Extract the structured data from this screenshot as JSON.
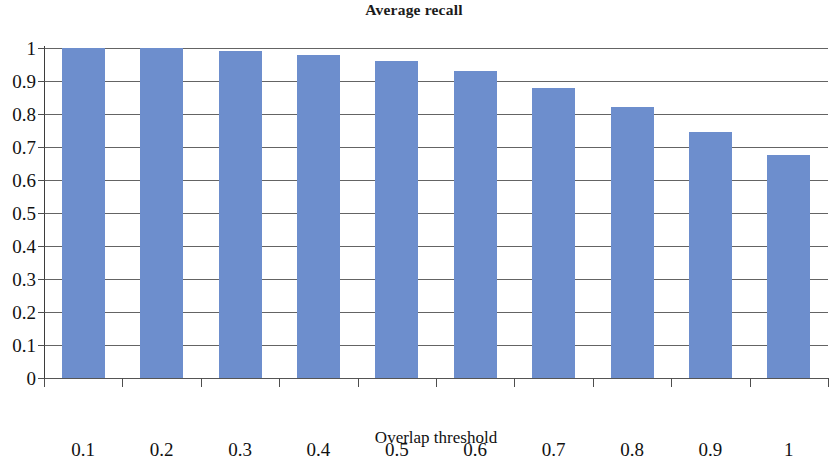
{
  "chart_data": {
    "type": "bar",
    "title": "Average recall",
    "xlabel": "Overlap threshold",
    "ylabel": "",
    "categories": [
      "0.1",
      "0.2",
      "0.3",
      "0.4",
      "0.5",
      "0.6",
      "0.7",
      "0.8",
      "0.9",
      "1"
    ],
    "values": [
      1.0,
      1.0,
      0.99,
      0.98,
      0.96,
      0.93,
      0.88,
      0.82,
      0.745,
      0.675
    ],
    "series": [
      {
        "name": "Average recall",
        "values": [
          1.0,
          1.0,
          0.99,
          0.98,
          0.96,
          0.93,
          0.88,
          0.82,
          0.745,
          0.675
        ]
      }
    ],
    "ylim": [
      0,
      1
    ],
    "ytick_labels": [
      "1",
      "0.9",
      "0.8",
      "0.7",
      "0.6",
      "0.5",
      "0.4",
      "0.3",
      "0.2",
      "0.1",
      "0"
    ],
    "ytick_values": [
      1,
      0.9,
      0.8,
      0.7,
      0.6,
      0.5,
      0.4,
      0.3,
      0.2,
      0.1,
      0
    ],
    "grid": true,
    "grid_axis": "y",
    "legend": false,
    "legend_position": "none",
    "bar_color": "#6d8ecd",
    "grid_color": "#4e4e4e",
    "axis_color": "#3d3d3d",
    "text_color": "#111111"
  },
  "scan_artifacts": [
    {
      "text": "",
      "left": 640,
      "top": 120
    },
    {
      "text": "",
      "left": 690,
      "top": 330
    }
  ]
}
